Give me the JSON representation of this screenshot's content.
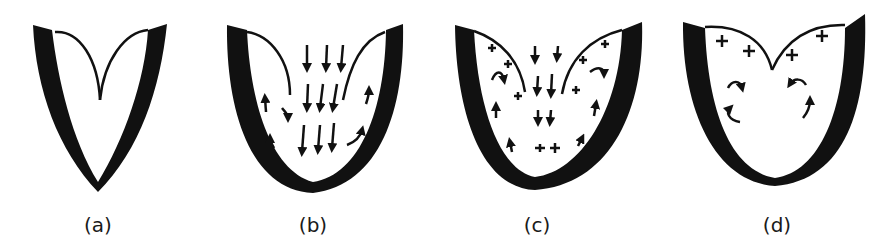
{
  "panels": [
    {
      "id": "a",
      "label": "(a)",
      "description": "valve leaflets closed, meeting at center"
    },
    {
      "id": "b",
      "label": "(b)",
      "description": "leaflets open, downward flow with vortices at sides"
    },
    {
      "id": "c",
      "label": "(c)",
      "description": "leaflets partially closing, flow with plus signs and vortices"
    },
    {
      "id": "d",
      "label": "(d)",
      "description": "leaflets nearly closed, plus signs near leaflets and circulating vortices"
    }
  ],
  "colors": {
    "ink": "#111111",
    "background": "#ffffff"
  }
}
